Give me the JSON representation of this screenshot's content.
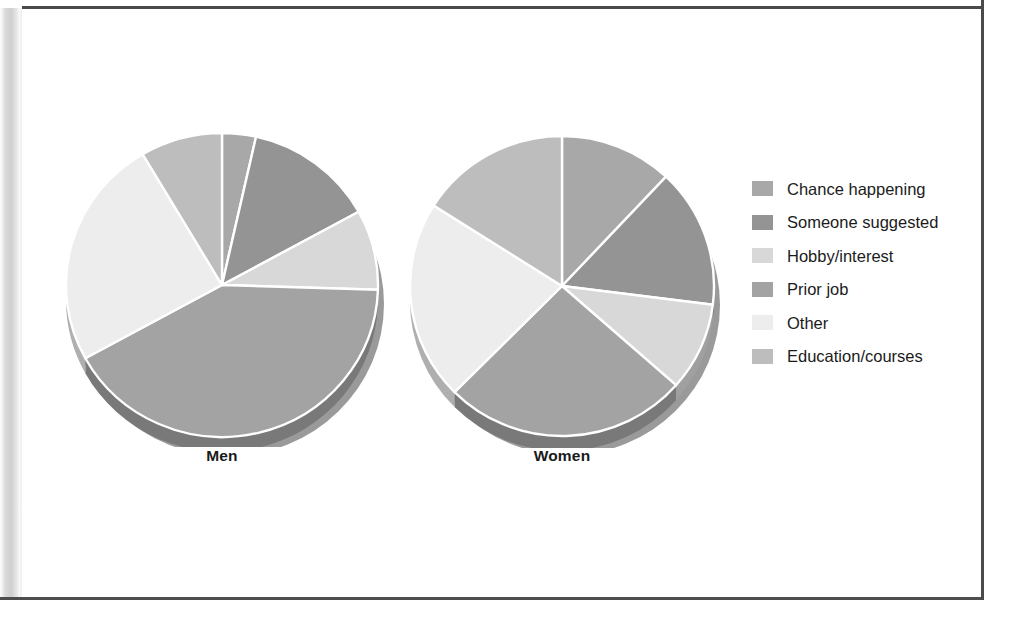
{
  "chart_data": {
    "type": "pie",
    "title": "",
    "subtitle": "",
    "xlabel": "",
    "ylabel": "",
    "grid": false,
    "legend_position": "right",
    "categories": [
      "Chance happening",
      "Someone suggested",
      "Hobby/interest",
      "Prior job",
      "Other",
      "Education/courses"
    ],
    "colors": [
      "#a8a8a8",
      "#949494",
      "#d8d8d8",
      "#a3a3a3",
      "#ededed",
      "#bdbdbd"
    ],
    "series": [
      {
        "name": "Men",
        "values": [
          3.5,
          13.5,
          8.5,
          41.5,
          24.5,
          8.5
        ],
        "units": "percent"
      },
      {
        "name": "Women",
        "values": [
          12.0,
          15.0,
          9.5,
          26.0,
          21.5,
          16.0
        ],
        "units": "percent"
      }
    ]
  },
  "legend": {
    "items": [
      {
        "label": "Chance happening",
        "color": "#a8a8a8"
      },
      {
        "label": "Someone suggested",
        "color": "#949494"
      },
      {
        "label": "Hobby/interest",
        "color": "#d8d8d8"
      },
      {
        "label": "Prior job",
        "color": "#a3a3a3"
      },
      {
        "label": "Other",
        "color": "#ededed"
      },
      {
        "label": "Education/courses",
        "color": "#bdbdbd"
      }
    ]
  },
  "pies": [
    {
      "caption": "Men"
    },
    {
      "caption": "Women"
    }
  ]
}
